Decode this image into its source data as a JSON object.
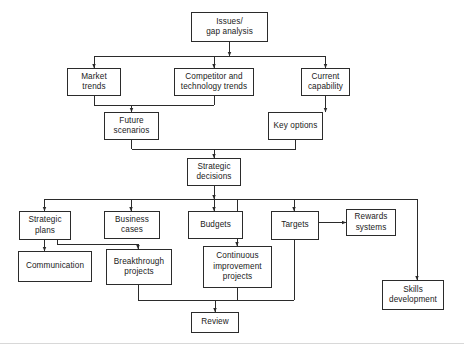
{
  "diagram": {
    "line_color": "#2b2b2b",
    "box_fill": "#ffffff",
    "nodes": [
      {
        "id": "issues",
        "label": "Issues/\ngap analysis",
        "x": 191,
        "y": 12,
        "w": 77,
        "h": 30
      },
      {
        "id": "market",
        "label": "Market\ntrends",
        "x": 67,
        "y": 68,
        "w": 54,
        "h": 28
      },
      {
        "id": "competitor",
        "label": "Competitor and\ntechnology trends",
        "x": 174,
        "y": 68,
        "w": 80,
        "h": 28
      },
      {
        "id": "capability",
        "label": "Current\ncapability",
        "x": 301,
        "y": 68,
        "w": 49,
        "h": 28
      },
      {
        "id": "future",
        "label": "Future\nscenarios",
        "x": 104,
        "y": 112,
        "w": 55,
        "h": 28
      },
      {
        "id": "keyoptions",
        "label": "Key options",
        "x": 268,
        "y": 112,
        "w": 55,
        "h": 28
      },
      {
        "id": "strategic_dec",
        "label": "Strategic\ndecisions",
        "x": 187,
        "y": 158,
        "w": 54,
        "h": 28
      },
      {
        "id": "plans",
        "label": "Strategic\nplans",
        "x": 19,
        "y": 211,
        "w": 52,
        "h": 29
      },
      {
        "id": "cases",
        "label": "Business\ncases",
        "x": 104,
        "y": 211,
        "w": 56,
        "h": 28
      },
      {
        "id": "budgets",
        "label": "Budgets",
        "x": 188,
        "y": 211,
        "w": 55,
        "h": 28
      },
      {
        "id": "targets",
        "label": "Targets",
        "x": 271,
        "y": 211,
        "w": 48,
        "h": 29
      },
      {
        "id": "rewards",
        "label": "Rewards\nsystems",
        "x": 346,
        "y": 209,
        "w": 50,
        "h": 27
      },
      {
        "id": "communication",
        "label": "Communication",
        "x": 18,
        "y": 251,
        "w": 74,
        "h": 31
      },
      {
        "id": "breakthrough",
        "label": "Breakthrough\nprojects",
        "x": 106,
        "y": 249,
        "w": 66,
        "h": 36
      },
      {
        "id": "continuous",
        "label": "Continuous\nimprovement\nprojects",
        "x": 203,
        "y": 246,
        "w": 69,
        "h": 42
      },
      {
        "id": "skills",
        "label": "Skills\ndevelopment",
        "x": 382,
        "y": 280,
        "w": 62,
        "h": 30
      },
      {
        "id": "review",
        "label": "Review",
        "x": 191,
        "y": 312,
        "w": 48,
        "h": 21
      }
    ],
    "edges": [
      {
        "from": "issues",
        "to": "market",
        "name": "edge-issues-to-market"
      },
      {
        "from": "issues",
        "to": "competitor",
        "name": "edge-issues-to-competitor"
      },
      {
        "from": "issues",
        "to": "capability",
        "name": "edge-issues-to-capability"
      },
      {
        "from": "market",
        "to": "future",
        "name": "edge-market-to-future"
      },
      {
        "from": "competitor",
        "to": "future",
        "name": "edge-competitor-to-future"
      },
      {
        "from": "capability",
        "to": "keyoptions",
        "name": "edge-capability-to-keyoptions"
      },
      {
        "from": "future",
        "to": "strategic_dec",
        "name": "edge-future-to-strategic-decisions"
      },
      {
        "from": "keyoptions",
        "to": "strategic_dec",
        "name": "edge-keyoptions-to-strategic-decisions"
      },
      {
        "from": "strategic_dec",
        "to": "plans",
        "name": "edge-decisions-to-strategic-plans"
      },
      {
        "from": "strategic_dec",
        "to": "cases",
        "name": "edge-decisions-to-business-cases"
      },
      {
        "from": "strategic_dec",
        "to": "budgets",
        "name": "edge-decisions-to-budgets"
      },
      {
        "from": "strategic_dec",
        "to": "continuous",
        "name": "edge-decisions-to-continuous-improvement"
      },
      {
        "from": "strategic_dec",
        "to": "targets",
        "name": "edge-decisions-to-targets"
      },
      {
        "from": "strategic_dec",
        "to": "skills",
        "name": "edge-decisions-to-skills-development"
      },
      {
        "from": "plans",
        "to": "communication",
        "name": "edge-plans-to-communication"
      },
      {
        "from": "plans",
        "to": "breakthrough",
        "name": "edge-plans-to-breakthrough"
      },
      {
        "from": "targets",
        "to": "rewards",
        "name": "edge-targets-to-rewards"
      },
      {
        "from": "breakthrough",
        "to": "review",
        "name": "edge-breakthrough-to-review"
      },
      {
        "from": "continuous",
        "to": "review",
        "name": "edge-continuous-to-review"
      },
      {
        "from": "targets",
        "to": "review",
        "name": "edge-targets-to-review"
      }
    ]
  }
}
